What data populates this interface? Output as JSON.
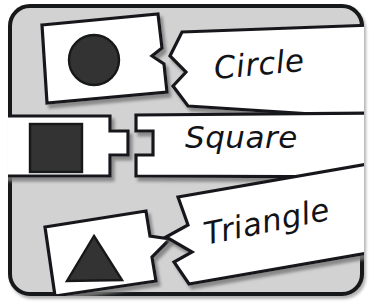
{
  "activity": {
    "title": "Shape Matching Puzzle",
    "board": {
      "background_color": "#d2d2d2",
      "border_color": "#16181a",
      "outside_color": "#ffffff"
    },
    "piece_style": {
      "fill_color": "#ffffff",
      "outline_color": "#16181a",
      "shadow_color": "#9a9a9a"
    },
    "shape_fill_color": "#333333",
    "rows": [
      {
        "id": "circle",
        "shape_icon": "circle-shape-icon",
        "label": "Circle",
        "shape_piece_name": "puzzle-piece-shape-circle",
        "label_piece_name": "puzzle-piece-label-circle",
        "connector": "chevron-tab",
        "shape_rotation_deg": 7,
        "label_rotation_deg": -5.2
      },
      {
        "id": "square",
        "shape_icon": "square-shape-icon",
        "label": "Square",
        "shape_piece_name": "puzzle-piece-shape-square",
        "label_piece_name": "puzzle-piece-label-square",
        "connector": "rectangular-tab",
        "shape_rotation_deg": 0,
        "label_rotation_deg": 0
      },
      {
        "id": "triangle",
        "shape_icon": "triangle-shape-icon",
        "label": "Triangle",
        "shape_piece_name": "puzzle-piece-shape-triangle",
        "label_piece_name": "puzzle-piece-label-triangle",
        "connector": "arrow-tab",
        "shape_rotation_deg": 9,
        "label_rotation_deg": -11.5
      }
    ]
  }
}
